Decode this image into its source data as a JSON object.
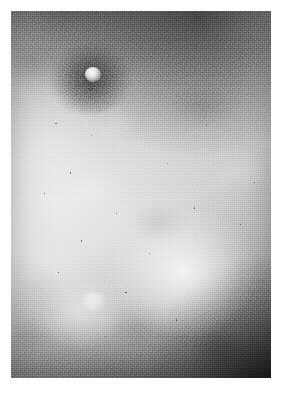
{
  "page": {
    "background_color": "#ffffff",
    "width": 282,
    "height": 396
  },
  "plate": {
    "name": "grayscale-photographic-plate",
    "subject": "close-up macrograph of human skin surface",
    "rendering": "black-and-white halftone / film-grain photographic print",
    "left": 11,
    "top": 11,
    "width": 260,
    "height": 367,
    "caption": ""
  },
  "tones": {
    "base_mid_gray": "#a8a8a8",
    "light_field": "#c6c6c6",
    "highlight": "#ededed",
    "shadow": "#6e6e6e",
    "deep_shadow": "#3a3a3a",
    "paper_white": "#ffffff"
  },
  "features": [
    {
      "name": "primary-lesion",
      "description": "mottled dark papule with bright white central core in upper-left quadrant",
      "center_x_pct": 31,
      "center_y_pct": 17,
      "tone": "#4a4a4a"
    },
    {
      "name": "lesion-bright-core",
      "description": "small intensely bright pustule head at the lesion centre",
      "center_x_pct": 31.5,
      "center_y_pct": 17.2,
      "tone": "#fafafa"
    },
    {
      "name": "top-dark-band",
      "description": "grainy dark band sweeping across the top and upper-right of the frame",
      "center_x_pct": 72,
      "center_y_pct": 4,
      "tone": "#555555"
    },
    {
      "name": "central-highlight",
      "description": "broad soft specular highlight below and right of centre",
      "center_x_pct": 66,
      "center_y_pct": 71,
      "tone": "#efefef"
    },
    {
      "name": "secondary-papule",
      "description": "faint rounded bump on the lower-left of the highlight",
      "center_x_pct": 31,
      "center_y_pct": 79,
      "tone": "#e2e2e2"
    },
    {
      "name": "bottom-right-vignette",
      "description": "deep shadow occupying the lower-right corner",
      "center_x_pct": 96,
      "center_y_pct": 98,
      "tone": "#2a2a2a"
    }
  ],
  "specks": [
    {
      "x_pct": 17.0,
      "y_pct": 30.5,
      "size": 1.5
    },
    {
      "x_pct": 30.6,
      "y_pct": 33.8,
      "size": 1.2
    },
    {
      "x_pct": 34.0,
      "y_pct": 27.0,
      "size": 1.1
    },
    {
      "x_pct": 22.5,
      "y_pct": 44.0,
      "size": 1.3
    },
    {
      "x_pct": 12.5,
      "y_pct": 49.5,
      "size": 1.6
    },
    {
      "x_pct": 40.5,
      "y_pct": 55.0,
      "size": 1.2
    },
    {
      "x_pct": 60.0,
      "y_pct": 41.5,
      "size": 1.1
    },
    {
      "x_pct": 70.5,
      "y_pct": 53.5,
      "size": 1.2
    },
    {
      "x_pct": 53.0,
      "y_pct": 66.0,
      "size": 1.1
    },
    {
      "x_pct": 27.0,
      "y_pct": 62.5,
      "size": 1.2
    },
    {
      "x_pct": 18.0,
      "y_pct": 71.0,
      "size": 1.4
    },
    {
      "x_pct": 44.0,
      "y_pct": 76.5,
      "size": 1.2
    },
    {
      "x_pct": 63.5,
      "y_pct": 84.0,
      "size": 1.3
    },
    {
      "x_pct": 36.0,
      "y_pct": 88.5,
      "size": 1.5
    },
    {
      "x_pct": 8.5,
      "y_pct": 84.0,
      "size": 1.2
    },
    {
      "x_pct": 75.0,
      "y_pct": 31.0,
      "size": 1.2
    },
    {
      "x_pct": 88.0,
      "y_pct": 58.0,
      "size": 1.1
    },
    {
      "x_pct": 93.5,
      "y_pct": 46.5,
      "size": 1.3
    },
    {
      "x_pct": 49.0,
      "y_pct": 19.0,
      "size": 1.0
    },
    {
      "x_pct": 26.0,
      "y_pct": 24.0,
      "size": 1.0
    }
  ]
}
